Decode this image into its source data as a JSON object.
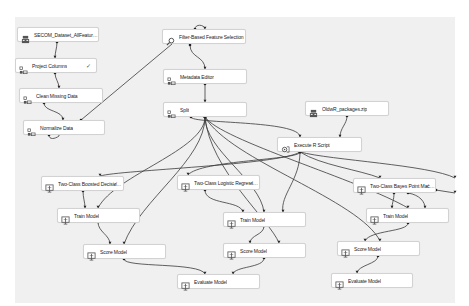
{
  "canvas": {
    "background": "#f0f0f0",
    "edge_color": "#3a3a3a"
  },
  "nodes": [
    {
      "id": "dataset",
      "label": "SECOM_Dataset_AllFeatures.cs...",
      "icon": "dataset-icon",
      "x": 17,
      "y": 27,
      "w": 82,
      "checked": false
    },
    {
      "id": "project_columns",
      "label": "Project Columns",
      "icon": "transform-icon",
      "x": 15,
      "y": 58,
      "w": 82,
      "checked": true
    },
    {
      "id": "clean_missing",
      "label": "Clean Missing Data",
      "icon": "transform-icon",
      "x": 19,
      "y": 88,
      "w": 84,
      "checked": false
    },
    {
      "id": "normalize",
      "label": "Normalize Data",
      "icon": "transform-icon",
      "x": 23,
      "y": 120,
      "w": 82,
      "checked": false
    },
    {
      "id": "filter_feature",
      "label": "Filter-Based Feature Selection",
      "icon": "search-icon",
      "x": 162,
      "y": 29,
      "w": 84,
      "checked": false
    },
    {
      "id": "metadata_editor",
      "label": "Metadata Editor",
      "icon": "transform-icon",
      "x": 163,
      "y": 69,
      "w": 84,
      "checked": false
    },
    {
      "id": "split",
      "label": "Split",
      "icon": "transform-icon",
      "x": 163,
      "y": 102,
      "w": 84,
      "checked": false
    },
    {
      "id": "r_packages",
      "label": "OldwR_packages.zip",
      "icon": "dataset-icon",
      "x": 305,
      "y": 101,
      "w": 84,
      "checked": false
    },
    {
      "id": "execute_r",
      "label": "Execute R Script",
      "icon": "script-icon",
      "x": 277,
      "y": 137,
      "w": 85,
      "checked": false
    },
    {
      "id": "boosted_tree",
      "label": "Two-Class Boosted Decision T...",
      "icon": "model-icon",
      "x": 41,
      "y": 176,
      "w": 83,
      "checked": true
    },
    {
      "id": "logistic",
      "label": "Two-Class Logistic Regression",
      "icon": "model-icon",
      "x": 177,
      "y": 175,
      "w": 83,
      "checked": true
    },
    {
      "id": "bayes",
      "label": "Two-Class Bayes Point Machine",
      "icon": "model-icon",
      "x": 353,
      "y": 178,
      "w": 83,
      "checked": true
    },
    {
      "id": "train1",
      "label": "Train Model",
      "icon": "model-icon",
      "x": 57,
      "y": 208,
      "w": 83,
      "checked": false
    },
    {
      "id": "train2",
      "label": "Train Model",
      "icon": "model-icon",
      "x": 223,
      "y": 212,
      "w": 83,
      "checked": false
    },
    {
      "id": "train3",
      "label": "Train Model",
      "icon": "model-icon",
      "x": 366,
      "y": 208,
      "w": 83,
      "checked": false
    },
    {
      "id": "score1",
      "label": "Score Model",
      "icon": "model-icon",
      "x": 83,
      "y": 244,
      "w": 83,
      "checked": false
    },
    {
      "id": "score2",
      "label": "Score Model",
      "icon": "model-icon",
      "x": 223,
      "y": 243,
      "w": 83,
      "checked": false
    },
    {
      "id": "score3",
      "label": "Score Model",
      "icon": "model-icon",
      "x": 337,
      "y": 241,
      "w": 83,
      "checked": false
    },
    {
      "id": "evaluate1",
      "label": "Evaluate Model",
      "icon": "model-icon",
      "x": 177,
      "y": 274,
      "w": 83,
      "checked": false
    },
    {
      "id": "evaluate2",
      "label": "Evaluate Model",
      "icon": "model-icon",
      "x": 331,
      "y": 273,
      "w": 82,
      "checked": false
    }
  ],
  "check_glyph": "✓",
  "edges": [
    {
      "from": "dataset",
      "to": "project_columns",
      "d": "M57,42 C57,48 55,52 55,58"
    },
    {
      "from": "project_columns",
      "to": "clean_missing",
      "d": "M55,73 C55,79 59,82 59,88"
    },
    {
      "from": "clean_missing",
      "to": "normalize",
      "d": "M44,103 C44,112 63,110 63,120"
    },
    {
      "from": "normalize",
      "to": "filter_feature",
      "d": "M81,120 L172,44"
    },
    {
      "from": "normalize",
      "to": "loop",
      "d": "M49,135 C49,140 55,139 59,136"
    },
    {
      "from": "filter_feature",
      "to": "loop_top",
      "d": "M195,29 C195,24 204,24 205,29"
    },
    {
      "from": "filter_feature",
      "to": "metadata_editor",
      "d": "M190,45 C190,58 205,56 205,69"
    },
    {
      "from": "metadata_editor",
      "to": "split",
      "d": "M205,84 L205,102"
    },
    {
      "from": "split",
      "to": "execute_r",
      "d": "M191,117 C191,124 300,120 300,137"
    },
    {
      "from": "r_packages",
      "to": "execute_r",
      "d": "M347,116 C347,124 340,128 340,137"
    },
    {
      "from": "split",
      "to": "train1",
      "d": "M205,117 C205,150 115,175 98,208"
    },
    {
      "from": "split",
      "to": "train2",
      "d": "M205,117 C205,150 260,180 264,212"
    },
    {
      "from": "split",
      "to": "train3",
      "d": "M205,117 C220,140 360,180 408,208"
    },
    {
      "from": "split",
      "to": "score1",
      "d": "M205,117 C205,160 140,200 124,244"
    },
    {
      "from": "split",
      "to": "score2",
      "d": "M205,117 C210,170 270,220 279,243"
    },
    {
      "from": "split",
      "to": "score3",
      "d": "M205,117 C230,160 360,200 380,241"
    },
    {
      "from": "execute_r",
      "to": "logistic",
      "d": "M300,152 C300,160 200,160 188,175"
    },
    {
      "from": "execute_r",
      "to": "boosted",
      "d": "M300,152 C280,165 120,170 100,176"
    },
    {
      "from": "execute_r",
      "to": "train2",
      "d": "M300,152 C300,180 280,195 283,212"
    },
    {
      "from": "execute_r",
      "to": "bayes",
      "d": "M300,152 C320,165 360,170 380,178"
    },
    {
      "from": "execute_r",
      "to": "right_out",
      "d": "M300,152 C330,160 430,165 455,178"
    },
    {
      "from": "boosted_tree",
      "to": "train1",
      "d": "M83,191 C83,198 85,202 85,208"
    },
    {
      "from": "logistic",
      "to": "train2",
      "d": "M205,190 C205,205 240,200 243,212"
    },
    {
      "from": "bayes",
      "to": "train3",
      "d": "M394,193 C394,200 392,203 392,208"
    },
    {
      "from": "bayes",
      "to": "train3b",
      "d": "M408,193 C420,195 425,202 425,208"
    },
    {
      "from": "bayes",
      "to": "right_out2",
      "d": "M436,190 L455,193"
    },
    {
      "from": "train1",
      "to": "score1",
      "d": "M98,222 C98,232 110,235 110,244"
    },
    {
      "from": "train2",
      "to": "score2",
      "d": "M264,226 C264,235 250,235 250,243"
    },
    {
      "from": "train3",
      "to": "score3",
      "d": "M408,223 C408,232 370,230 365,241"
    },
    {
      "from": "score1",
      "to": "evaluate1",
      "d": "M124,259 C124,268 200,262 205,274"
    },
    {
      "from": "score2",
      "to": "evaluate1",
      "d": "M264,258 C264,268 235,266 233,274"
    },
    {
      "from": "score3",
      "to": "evaluate2",
      "d": "M378,256 C378,264 358,265 357,273"
    }
  ]
}
